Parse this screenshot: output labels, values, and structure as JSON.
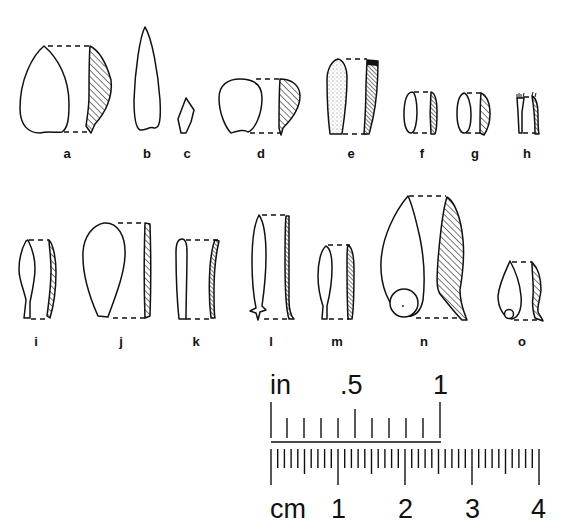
{
  "figure": {
    "type": "archaeological artifact line drawings with scale bar",
    "artifact_labels": [
      "a",
      "b",
      "c",
      "d",
      "e",
      "f",
      "g",
      "h",
      "i",
      "j",
      "k",
      "l",
      "m",
      "n",
      "o"
    ],
    "rows": [
      {
        "row": 1,
        "items": [
          "a",
          "b",
          "c",
          "d",
          "e",
          "f",
          "g",
          "h"
        ]
      },
      {
        "row": 2,
        "items": [
          "i",
          "j",
          "k",
          "l",
          "m",
          "n",
          "o"
        ]
      }
    ],
    "colors": {
      "ink": "#111111",
      "background": "#ffffff"
    }
  },
  "labels": {
    "a": "a",
    "b": "b",
    "c": "c",
    "d": "d",
    "e": "e",
    "f": "f",
    "g": "g",
    "h": "h",
    "i": "i",
    "j": "j",
    "k": "k",
    "l": "l",
    "m": "m",
    "n": "n",
    "o": "o"
  },
  "scale": {
    "inch_unit": "in",
    "inch_ticks": [
      ".5",
      "1"
    ],
    "cm_unit": "cm",
    "cm_ticks": [
      "1",
      "2",
      "3",
      "4"
    ]
  }
}
